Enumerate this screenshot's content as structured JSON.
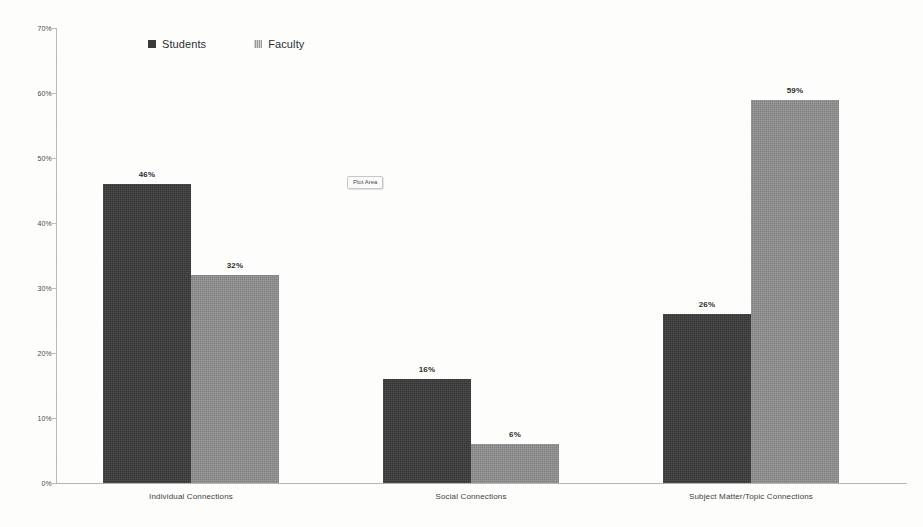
{
  "chart_data": {
    "type": "bar",
    "title": "",
    "subtitle": "",
    "xlabel": "",
    "ylabel": "",
    "categories": [
      "Individual Connections",
      "Social Connections",
      "Subject Matter/Topic Connections"
    ],
    "series": [
      {
        "name": "Students",
        "color": "#3a3a3a",
        "values": [
          46,
          16,
          26
        ],
        "value_labels": [
          "46%",
          "16%",
          "26%"
        ]
      },
      {
        "name": "Faculty",
        "color": "#8d8d8d",
        "values": [
          32,
          6,
          59
        ],
        "value_labels": [
          "32%",
          "6%",
          "59%"
        ]
      }
    ],
    "ylim": [
      0,
      70
    ],
    "ytick_values": [
      0,
      10,
      20,
      30,
      40,
      50,
      60,
      70
    ],
    "ytick_labels": [
      "0%",
      "10%",
      "20%",
      "30%",
      "40%",
      "50%",
      "60%",
      "70%"
    ],
    "grid": false,
    "legend_position": "top-left-center",
    "legend_entries": [
      "Students",
      "Faculty"
    ]
  },
  "annotations": {
    "plot_area_tooltip": "Plot Area"
  },
  "axis": {
    "y_axis_line_color": "#b9b9b9",
    "x_axis_line_color": "#b4b4b4"
  },
  "background": {
    "page_color": "#fdfdfc"
  }
}
